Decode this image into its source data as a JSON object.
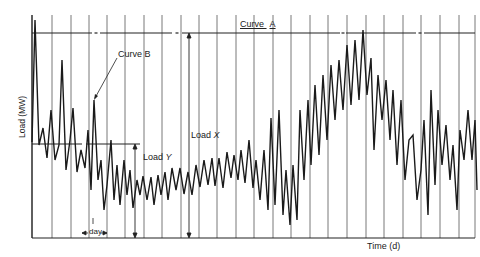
{
  "chart_data": {
    "type": "line",
    "title": "",
    "xlabel": "Time (d)",
    "ylabel": "Load (MW)",
    "grid": {
      "vertical": true,
      "horizontal": false,
      "vertical_spacing": "1 day"
    },
    "series": [
      {
        "name": "Curve B",
        "description": "Daily-fluctuating load profile",
        "points_px": [
          [
            32,
            142
          ],
          [
            35,
            20
          ],
          [
            39,
            145
          ],
          [
            43,
            128
          ],
          [
            47,
            158
          ],
          [
            51,
            110
          ],
          [
            55,
            160
          ],
          [
            59,
            145
          ],
          [
            62,
            60
          ],
          [
            66,
            170
          ],
          [
            70,
            140
          ],
          [
            73,
            108
          ],
          [
            77,
            172
          ],
          [
            81,
            150
          ],
          [
            85,
            168
          ],
          [
            88,
            130
          ],
          [
            91,
            190
          ],
          [
            94,
            100
          ],
          [
            98,
            180
          ],
          [
            101,
            160
          ],
          [
            104,
            210
          ],
          [
            107,
            185
          ],
          [
            111,
            140
          ],
          [
            114,
            200
          ],
          [
            117,
            165
          ],
          [
            120,
            205
          ],
          [
            124,
            160
          ],
          [
            127,
            195
          ],
          [
            130,
            170
          ],
          [
            133,
            208
          ],
          [
            137,
            180
          ],
          [
            140,
            195
          ],
          [
            143,
            176
          ],
          [
            147,
            200
          ],
          [
            151,
            177
          ],
          [
            154,
            205
          ],
          [
            158,
            175
          ],
          [
            161,
            195
          ],
          [
            165,
            172
          ],
          [
            168,
            200
          ],
          [
            172,
            168
          ],
          [
            176,
            190
          ],
          [
            180,
            168
          ],
          [
            184,
            194
          ],
          [
            188,
            172
          ],
          [
            192,
            195
          ],
          [
            196,
            165
          ],
          [
            200,
            187
          ],
          [
            204,
            160
          ],
          [
            208,
            185
          ],
          [
            212,
            158
          ],
          [
            215,
            186
          ],
          [
            219,
            158
          ],
          [
            223,
            188
          ],
          [
            227,
            152
          ],
          [
            231,
            178
          ],
          [
            234,
            155
          ],
          [
            238,
            180
          ],
          [
            241,
            150
          ],
          [
            245,
            183
          ],
          [
            249,
            140
          ],
          [
            253,
            188
          ],
          [
            256,
            160
          ],
          [
            260,
            200
          ],
          [
            264,
            150
          ],
          [
            268,
            210
          ],
          [
            271,
            118
          ],
          [
            275,
            205
          ],
          [
            279,
            110
          ],
          [
            283,
            215
          ],
          [
            286,
            170
          ],
          [
            290,
            225
          ],
          [
            293,
            165
          ],
          [
            297,
            220
          ],
          [
            300,
            110
          ],
          [
            304,
            180
          ],
          [
            308,
            100
          ],
          [
            311,
            165
          ],
          [
            315,
            85
          ],
          [
            319,
            155
          ],
          [
            323,
            75
          ],
          [
            327,
            140
          ],
          [
            331,
            65
          ],
          [
            335,
            120
          ],
          [
            339,
            60
          ],
          [
            343,
            110
          ],
          [
            347,
            45
          ],
          [
            351,
            105
          ],
          [
            355,
            40
          ],
          [
            359,
            100
          ],
          [
            363,
            30
          ],
          [
            367,
            95
          ],
          [
            371,
            58
          ],
          [
            374,
            150
          ],
          [
            378,
            75
          ],
          [
            382,
            120
          ],
          [
            386,
            80
          ],
          [
            390,
            140
          ],
          [
            393,
            90
          ],
          [
            397,
            165
          ],
          [
            401,
            100
          ],
          [
            405,
            180
          ],
          [
            409,
            140
          ],
          [
            413,
            135
          ],
          [
            417,
            200
          ],
          [
            421,
            170
          ],
          [
            424,
            120
          ],
          [
            428,
            215
          ],
          [
            431,
            90
          ],
          [
            435,
            185
          ],
          [
            438,
            110
          ],
          [
            442,
            165
          ],
          [
            446,
            125
          ],
          [
            450,
            180
          ],
          [
            453,
            145
          ],
          [
            457,
            210
          ],
          [
            460,
            130
          ],
          [
            464,
            160
          ],
          [
            468,
            110
          ],
          [
            472,
            160
          ],
          [
            475,
            120
          ],
          [
            477,
            190
          ]
        ]
      },
      {
        "name": "Curve A",
        "description": "Horizontal reference line at peak load",
        "y_px": 33,
        "x_range_px": [
          32,
          475
        ],
        "gaps_px": [
          [
            92,
            100
          ],
          [
            172,
            182
          ],
          [
            340,
            346
          ],
          [
            416,
            424
          ]
        ]
      }
    ],
    "reference_lines": [
      {
        "name": "Load Y baseline",
        "y_px": 144,
        "x_range_px": [
          32,
          140
        ],
        "gap_px": [
          82,
          86
        ]
      }
    ],
    "dimensions": [
      {
        "name": "Load X",
        "x_px": 189,
        "y_from_px": 33,
        "y_to_px": 238
      },
      {
        "name": "Load Y",
        "x_px": 135,
        "y_from_px": 144,
        "y_to_px": 238
      }
    ],
    "vertical_gridlines_px": [
      32,
      52,
      71,
      89,
      107,
      125,
      144,
      162,
      181,
      199,
      217,
      236,
      254,
      273,
      291,
      310,
      328,
      347,
      366,
      384,
      403,
      421,
      440,
      459,
      475
    ],
    "annotations": [
      {
        "text": "Curve A",
        "x_px": 245,
        "y_px": 25
      },
      {
        "text": "Curve B",
        "x_px": 120,
        "y_px": 80,
        "arrow_to_px": [
          94,
          100
        ]
      },
      {
        "text": "Load X",
        "x_px": 192,
        "y_px": 133
      },
      {
        "text": "Load Y",
        "x_px": 143,
        "y_px": 152
      },
      {
        "text": "day",
        "x_px": 92,
        "y_px": 228,
        "span_px": [
          81,
          107
        ]
      }
    ],
    "plot_area_px": {
      "left": 32,
      "right": 475,
      "top": 15,
      "bottom": 238
    }
  },
  "labels": {
    "curve_a": "Curve",
    "curve_a_letter": "A",
    "curve_b": "Curve B",
    "load_x": "Load",
    "load_x_var": "X",
    "load_y": "Load",
    "load_y_var": "Y",
    "day": "day",
    "xlabel": "Time (d)",
    "ylabel": "Load (MW)"
  }
}
